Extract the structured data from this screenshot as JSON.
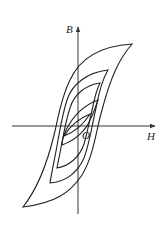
{
  "diagram": {
    "axes": {
      "x_label": "H",
      "y_label": "B",
      "origin_label": "O"
    },
    "loops": [
      {
        "name": "outer-loop"
      },
      {
        "name": "second-loop"
      },
      {
        "name": "third-loop"
      },
      {
        "name": "fourth-loop"
      },
      {
        "name": "innermost-loop"
      }
    ]
  }
}
